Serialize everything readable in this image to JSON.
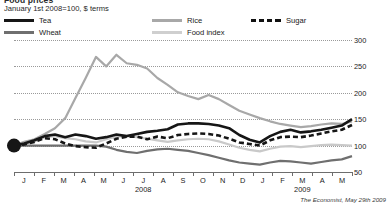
{
  "header": {
    "title": "Food prices",
    "subtitle": "January 1st 2008=100, $ terms"
  },
  "legend": {
    "tea": "Tea",
    "wheat": "Wheat",
    "rice": "Rice",
    "food_index": "Food index",
    "sugar": "Sugar"
  },
  "source": {
    "publication": "The Economist",
    "date": ", May 29th 2009"
  },
  "colors": {
    "tea": "#161616",
    "sugar": "#161616",
    "wheat": "#6f6f6f",
    "rice": "#a8a8a8",
    "food_index": "#c9c9c9",
    "gridline": "#9a9a9a",
    "axis": "#6d6d6d",
    "text": "#1a1a1a",
    "background": "#ffffff"
  },
  "axes": {
    "y_ticks": [
      "300",
      "250",
      "200",
      "150",
      "100",
      "50"
    ],
    "y_values": [
      300,
      250,
      200,
      150,
      100,
      50
    ],
    "ylim": [
      50,
      300
    ],
    "x_ticks": [
      "J",
      "F",
      "M",
      "A",
      "M",
      "J",
      "J",
      "A",
      "S",
      "O",
      "N",
      "D",
      "J",
      "F",
      "M",
      "A",
      "M"
    ],
    "year_labels": [
      {
        "label": "2008",
        "index": 6
      },
      {
        "label": "2009",
        "index": 14
      }
    ],
    "grid": true,
    "legend_position": "top"
  },
  "chart_data": {
    "type": "line",
    "title": "Food prices",
    "subtitle": "January 1st 2008=100, $ terms",
    "xlabel": "",
    "ylabel": "Index (January 1st 2008 = 100)",
    "ylim": [
      50,
      300
    ],
    "grid": true,
    "legend_position": "top",
    "x": [
      "2008-01",
      "2008-01.5",
      "2008-02",
      "2008-02.5",
      "2008-03",
      "2008-03.5",
      "2008-04",
      "2008-04.5",
      "2008-05",
      "2008-05.5",
      "2008-06",
      "2008-06.5",
      "2008-07",
      "2008-07.5",
      "2008-08",
      "2008-08.5",
      "2008-09",
      "2008-09.5",
      "2008-10",
      "2008-10.5",
      "2008-11",
      "2008-11.5",
      "2008-12",
      "2008-12.5",
      "2009-01",
      "2009-01.5",
      "2009-02",
      "2009-02.5",
      "2009-03",
      "2009-03.5",
      "2009-04",
      "2009-04.5",
      "2009-05",
      "2009-05.5"
    ],
    "series": [
      {
        "name": "Tea",
        "color": "#161616",
        "style": "solid",
        "values": [
          100,
          104,
          110,
          118,
          121,
          116,
          121,
          118,
          113,
          116,
          121,
          118,
          122,
          126,
          128,
          131,
          140,
          142,
          142,
          141,
          138,
          133,
          120,
          111,
          106,
          118,
          126,
          130,
          125,
          127,
          130,
          134,
          138,
          150
        ]
      },
      {
        "name": "Sugar",
        "color": "#161616",
        "style": "dashed",
        "values": [
          100,
          102,
          107,
          114,
          112,
          104,
          99,
          97,
          96,
          104,
          113,
          117,
          117,
          112,
          117,
          114,
          120,
          122,
          123,
          122,
          119,
          113,
          106,
          103,
          100,
          110,
          116,
          117,
          116,
          119,
          123,
          127,
          130,
          139
        ]
      },
      {
        "name": "Rice",
        "color": "#a8a8a8",
        "style": "solid",
        "values": [
          100,
          107,
          112,
          122,
          133,
          152,
          190,
          228,
          268,
          250,
          272,
          256,
          253,
          246,
          228,
          215,
          201,
          194,
          188,
          196,
          188,
          177,
          166,
          159,
          152,
          146,
          141,
          138,
          135,
          137,
          140,
          142,
          141,
          146
        ]
      },
      {
        "name": "Food index",
        "color": "#c9c9c9",
        "style": "solid",
        "values": [
          100,
          103,
          108,
          116,
          118,
          114,
          112,
          108,
          106,
          112,
          117,
          118,
          116,
          113,
          110,
          107,
          110,
          112,
          113,
          112,
          108,
          102,
          96,
          92,
          89,
          94,
          98,
          99,
          97,
          99,
          101,
          102,
          101,
          100
        ]
      },
      {
        "name": "Wheat",
        "color": "#6f6f6f",
        "style": "solid",
        "values": [
          100,
          100,
          100,
          100,
          100,
          100,
          100,
          100,
          100,
          98,
          92,
          88,
          86,
          90,
          93,
          94,
          92,
          90,
          86,
          82,
          77,
          72,
          68,
          66,
          64,
          68,
          71,
          70,
          68,
          66,
          69,
          72,
          74,
          80
        ]
      }
    ],
    "annotations": [
      {
        "type": "origin-marker",
        "x": "2008-01",
        "y": 100,
        "note": "Large filled dot marking the January 1st 2008 = 100 base point"
      }
    ]
  }
}
